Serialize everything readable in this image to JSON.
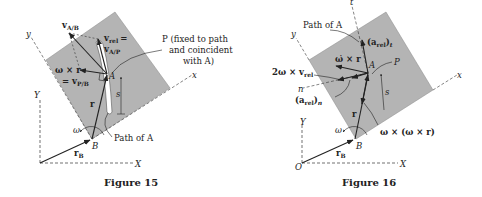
{
  "figures": [
    {
      "caption": "Figure 15",
      "labels": {
        "v_AB": "v",
        "v_AB_sub": "A/B",
        "v_rel_line1": "v",
        "v_rel_line1_sub": "rel",
        "v_rel_eq": "=",
        "v_rel_line2": "v",
        "v_rel_line2_sub": "A/P",
        "P_note_1": "P (fixed to path",
        "P_note_2": "and coincident",
        "P_note_3": "with A)",
        "omega_x_r": "ω × r",
        "eq_v_PB": "= v",
        "eq_v_PB_sub": "P/B",
        "A": "A",
        "s": "s",
        "r": "r",
        "Y": "Y",
        "X": "X",
        "x": "x",
        "y": "y",
        "B": "B",
        "omega": "ω",
        "r_B": "r",
        "r_B_sub": "B",
        "path_of_A": "Path of A"
      }
    },
    {
      "caption": "Figure 16",
      "labels": {
        "t": "t",
        "path_of_A": "Path of A",
        "a_rel_t": "(a",
        "a_rel_t_sub": "rel",
        "a_rel_t_close": ")",
        "a_rel_t_sub2": "t",
        "omega_dot_x_r": "ω̇ × r",
        "A": "A",
        "P": "P",
        "two_omega_x_vrel": "2ω × v",
        "two_omega_x_vrel_sub": "rel",
        "n": "n",
        "a_rel_n": "(a",
        "a_rel_n_sub": "rel",
        "a_rel_n_close": ")",
        "a_rel_n_sub2": "n",
        "s": "s",
        "r": "r",
        "Y": "Y",
        "X": "X",
        "x": "x",
        "y": "y",
        "B": "B",
        "O": "O",
        "omega": "ω",
        "r_B": "r",
        "r_B_sub": "B",
        "omega_x_omega_x_r": "ω × (ω × r)"
      }
    }
  ],
  "colors": {
    "plate": "#b4b4b4",
    "ink": "#222222",
    "background": "#ffffff"
  }
}
